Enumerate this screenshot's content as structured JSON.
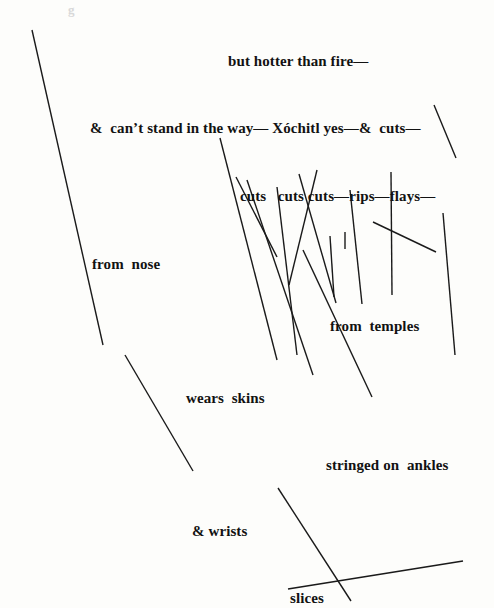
{
  "page": {
    "width": 494,
    "height": 608,
    "background_color": "#fdfdfb",
    "ink_color": "#121212",
    "stroke_color": "#1a1a1a",
    "faint_mark_color": "#d8d8d8"
  },
  "faint_mark": {
    "text": "g",
    "x": 68,
    "y": 2
  },
  "text_lines": [
    {
      "id": "line-1",
      "text": "but hotter than fire—",
      "x": 228,
      "y": 54,
      "size": 15
    },
    {
      "id": "line-2",
      "text": "&  can’t stand in the way— Xóchitl yes—&  cuts—",
      "x": 90,
      "y": 121,
      "size": 15
    },
    {
      "id": "line-3",
      "text": "cuts   cuts cuts—rips—flays—",
      "x": 240,
      "y": 189,
      "size": 15
    },
    {
      "id": "line-4",
      "text": "from  nose",
      "x": 92,
      "y": 257,
      "size": 15
    },
    {
      "id": "line-5",
      "text": "from  temples",
      "x": 330,
      "y": 319,
      "size": 15
    },
    {
      "id": "line-6",
      "text": "wears  skins",
      "x": 186,
      "y": 391,
      "size": 15
    },
    {
      "id": "line-7",
      "text": "stringed on  ankles",
      "x": 326,
      "y": 458,
      "size": 15
    },
    {
      "id": "line-8",
      "text": "& wrists",
      "x": 192,
      "y": 524,
      "size": 15
    },
    {
      "id": "line-9",
      "text": "slices",
      "x": 290,
      "y": 591,
      "size": 15
    }
  ],
  "strokes": [
    {
      "id": "stroke-left-long",
      "x1": 32,
      "y1": 30,
      "x2": 103,
      "y2": 345,
      "w": 1.4
    },
    {
      "id": "stroke-left-lower",
      "x1": 125,
      "y1": 355,
      "x2": 193,
      "y2": 471,
      "w": 1.4
    },
    {
      "id": "stroke-center-a",
      "x1": 220,
      "y1": 138,
      "x2": 277,
      "y2": 360,
      "w": 1.4
    },
    {
      "id": "stroke-center-b",
      "x1": 236,
      "y1": 177,
      "x2": 277,
      "y2": 257,
      "w": 1.4
    },
    {
      "id": "stroke-center-c",
      "x1": 247,
      "y1": 180,
      "x2": 313,
      "y2": 375,
      "w": 1.4
    },
    {
      "id": "stroke-center-d",
      "x1": 277,
      "y1": 187,
      "x2": 297,
      "y2": 355,
      "w": 1.4
    },
    {
      "id": "stroke-center-e",
      "x1": 317,
      "y1": 170,
      "x2": 289,
      "y2": 285,
      "w": 1.4
    },
    {
      "id": "stroke-center-f",
      "x1": 303,
      "y1": 250,
      "x2": 372,
      "y2": 397,
      "w": 1.4
    },
    {
      "id": "stroke-center-g",
      "x1": 330,
      "y1": 236,
      "x2": 334,
      "y2": 297,
      "w": 1.4
    },
    {
      "id": "stroke-center-h",
      "x1": 345,
      "y1": 232,
      "x2": 345,
      "y2": 249,
      "w": 1.4
    },
    {
      "id": "stroke-center-i",
      "x1": 350,
      "y1": 190,
      "x2": 362,
      "y2": 304,
      "w": 1.4
    },
    {
      "id": "stroke-center-j",
      "x1": 299,
      "y1": 174,
      "x2": 336,
      "y2": 303,
      "w": 1.4
    },
    {
      "id": "stroke-right-a",
      "x1": 434,
      "y1": 105,
      "x2": 456,
      "y2": 158,
      "w": 1.4
    },
    {
      "id": "stroke-right-b",
      "x1": 391,
      "y1": 172,
      "x2": 392,
      "y2": 295,
      "w": 1.4
    },
    {
      "id": "stroke-right-c",
      "x1": 373,
      "y1": 222,
      "x2": 436,
      "y2": 252,
      "w": 1.4
    },
    {
      "id": "stroke-right-d",
      "x1": 443,
      "y1": 213,
      "x2": 455,
      "y2": 355,
      "w": 1.4
    },
    {
      "id": "stroke-bottom-diagonal",
      "x1": 278,
      "y1": 488,
      "x2": 351,
      "y2": 601,
      "w": 1.4
    },
    {
      "id": "stroke-bottom-horizontal",
      "x1": 288,
      "y1": 589,
      "x2": 463,
      "y2": 561,
      "w": 1.4
    }
  ]
}
